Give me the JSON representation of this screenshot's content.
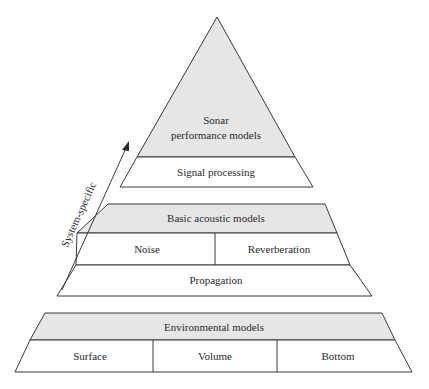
{
  "diagram": {
    "type": "layered-pyramid",
    "tiers": [
      {
        "name": "Sonar performance models",
        "title_lines": [
          "Sonar",
          "performance models"
        ],
        "sub_rows": [
          {
            "cells": [
              "Signal processing"
            ]
          }
        ]
      },
      {
        "name": "Basic acoustic models",
        "title": "Basic acoustic models",
        "sub_rows": [
          {
            "cells": [
              "Noise",
              "Reverberation"
            ]
          },
          {
            "cells": [
              "Propagation"
            ]
          }
        ]
      },
      {
        "name": "Environmental models",
        "title": "Environmental models",
        "sub_rows": [
          {
            "cells": [
              "Surface",
              "Volume",
              "Bottom"
            ]
          }
        ]
      }
    ],
    "arrow": {
      "label": "System-specific",
      "direction": "up"
    },
    "colors": {
      "header_fill": "#e6e6e6",
      "cell_fill": "#ffffff",
      "stroke": "#3a3a3a",
      "text": "#2a2a2a"
    }
  }
}
